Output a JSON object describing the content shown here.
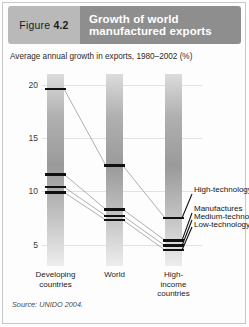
{
  "figure": {
    "label_prefix": "Figure",
    "label_number": "4.2",
    "title_line1": "Growth of world",
    "title_line2": "manufactured exports",
    "subtitle": "Average annual growth in exports, 1980–2002 (%)",
    "source": "Source: UNIDO 2004."
  },
  "colors": {
    "tab_bg": "#b9b9b9",
    "title_bg": "#8e8e8e",
    "title_text": "#ffffff",
    "marker": "#101010",
    "gridline": "#e2e2e2"
  },
  "chart_data": {
    "type": "line",
    "title": "Growth of world manufactured exports",
    "subtitle": "Average annual growth in exports, 1980–2002 (%)",
    "xlabel": "",
    "ylabel": "",
    "ylim": [
      3,
      21
    ],
    "yticks": [
      20,
      15,
      10,
      5
    ],
    "ytick_labels": [
      "20",
      "15",
      "10",
      "5"
    ],
    "grid": true,
    "legend_position": "right",
    "categories": [
      "Developing countries",
      "World",
      "High-income countries"
    ],
    "category_labels": [
      [
        "Developing",
        "countries"
      ],
      [
        "World"
      ],
      [
        "High-",
        "income",
        "countries"
      ]
    ],
    "series": [
      {
        "name": "High-technology",
        "values": [
          19.6,
          12.4,
          7.5
        ]
      },
      {
        "name": "Manufactures",
        "values": [
          11.6,
          8.3,
          5.4
        ]
      },
      {
        "name": "Medium-technology",
        "values": [
          10.4,
          7.7,
          4.9
        ]
      },
      {
        "name": "Low-technology",
        "values": [
          9.9,
          7.3,
          4.5
        ]
      }
    ],
    "annotations": [
      "Source: UNIDO 2004."
    ]
  }
}
